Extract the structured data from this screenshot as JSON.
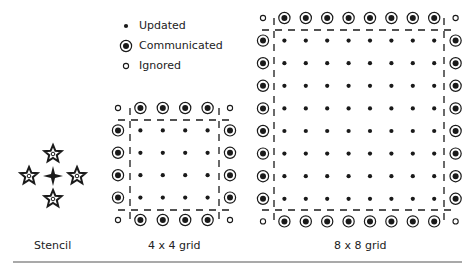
{
  "legend": {
    "items": [
      {
        "label": "Updated",
        "symbol": "filled-dot"
      },
      {
        "label": "Communicated",
        "symbol": "ringed-dot"
      },
      {
        "label": "Ignored",
        "symbol": "open-circle"
      }
    ]
  },
  "panels": {
    "stencil": {
      "label": "Stencil",
      "center": [
        53,
        176
      ],
      "arms": [
        [
          53,
          154
        ],
        [
          29,
          176
        ],
        [
          77,
          176
        ],
        [
          53,
          199
        ]
      ]
    },
    "grid4": {
      "label": "4 x 4 grid",
      "n": 4,
      "x0": 118,
      "y0": 108,
      "step": 22.4,
      "box": {
        "left": 130,
        "right": 219,
        "top": 120,
        "bottom": 210
      }
    },
    "grid8": {
      "label": "8 x 8 grid",
      "n": 8,
      "x0": 263,
      "y0": 18,
      "step": 21.4,
      "ystep": 22.6,
      "box": {
        "left": 274,
        "right": 444,
        "top": 30,
        "bottom": 210
      }
    }
  },
  "colors": {
    "ink": "#1a1a1a",
    "rule": "#555555"
  }
}
